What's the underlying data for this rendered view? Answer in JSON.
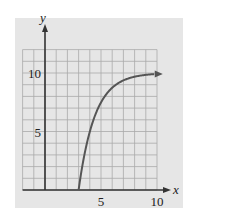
{
  "chart_data": {
    "type": "line",
    "title": "",
    "xlabel": "x",
    "ylabel": "y",
    "xlim": [
      -2,
      10
    ],
    "ylim": [
      -2,
      12
    ],
    "x_ticks": [
      5,
      10
    ],
    "y_ticks": [
      5,
      10
    ],
    "x_tick_labels": [
      "5",
      "10"
    ],
    "y_tick_labels": [
      "5",
      "10"
    ],
    "grid": true,
    "legend": null,
    "series": [
      {
        "name": "curve",
        "x": [
          3,
          3.5,
          4,
          4.5,
          5,
          6,
          7,
          8,
          9,
          10
        ],
        "y": [
          0,
          2.9,
          5.0,
          6.5,
          7.5,
          8.75,
          9.4,
          9.7,
          9.85,
          9.92
        ],
        "arrow_end": true,
        "color": "#555555"
      }
    ]
  },
  "colors": {
    "panel_bg": "#e6e6e6",
    "grid": "#a8a8a8",
    "axis": "#333333",
    "curve": "#555555"
  }
}
